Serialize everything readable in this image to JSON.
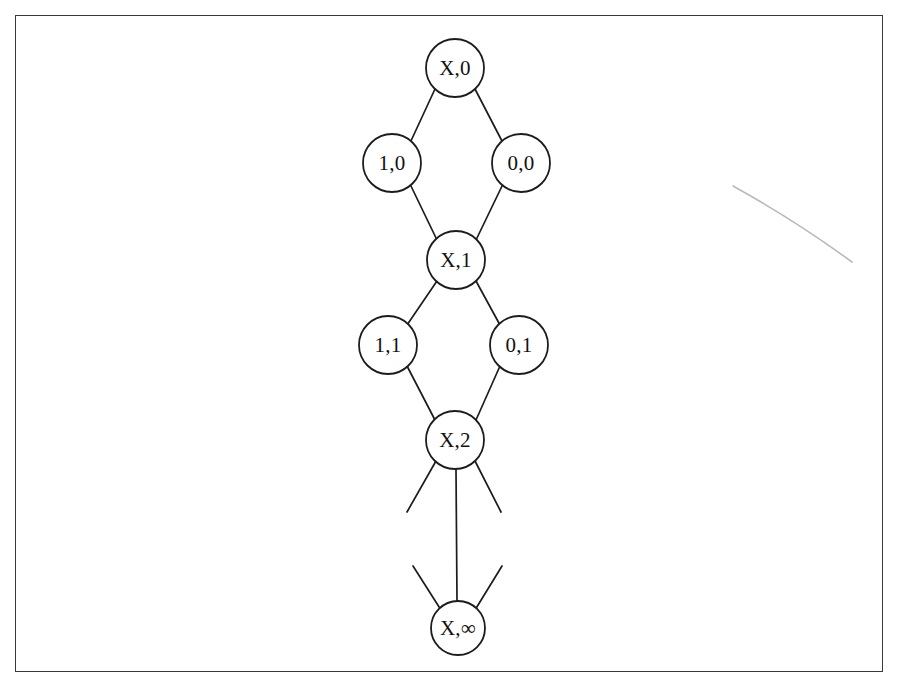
{
  "figure": {
    "title": "",
    "background_color": "#ffffff",
    "frame_color": "#3a3a3a",
    "stroke_color": "#1c1c1c",
    "label_color": "#111111",
    "width": 898,
    "height": 685
  },
  "diagram": {
    "type": "graph",
    "node_radius": 29,
    "nodes": [
      {
        "id": "x0",
        "label": "X,0",
        "cx": 455,
        "cy": 68,
        "r": 29,
        "font_size": 21
      },
      {
        "id": "n10",
        "label": "1,0",
        "cx": 392,
        "cy": 163,
        "r": 29,
        "font_size": 21
      },
      {
        "id": "n00",
        "label": "0,0",
        "cx": 521,
        "cy": 163,
        "r": 29,
        "font_size": 21
      },
      {
        "id": "x1",
        "label": "X,1",
        "cx": 456,
        "cy": 260,
        "r": 29,
        "font_size": 21
      },
      {
        "id": "n11",
        "label": "1,1",
        "cx": 388,
        "cy": 345,
        "r": 29,
        "font_size": 21
      },
      {
        "id": "n01",
        "label": "0,1",
        "cx": 519,
        "cy": 345,
        "r": 29,
        "font_size": 21
      },
      {
        "id": "x2",
        "label": "X,2",
        "cx": 455,
        "cy": 440,
        "r": 29,
        "font_size": 21
      },
      {
        "id": "xinf",
        "label": "X,∞",
        "cx": 458,
        "cy": 628,
        "r": 27,
        "font_size": 21
      }
    ],
    "edges": [
      {
        "from": "x0",
        "to": "n10",
        "x1": 435,
        "y1": 89,
        "x2": 410,
        "y2": 143
      },
      {
        "from": "x0",
        "to": "n00",
        "x1": 475,
        "y1": 89,
        "x2": 503,
        "y2": 143
      },
      {
        "from": "n10",
        "to": "x1",
        "x1": 410,
        "y1": 184,
        "x2": 437,
        "y2": 240
      },
      {
        "from": "n00",
        "to": "x1",
        "x1": 503,
        "y1": 184,
        "x2": 476,
        "y2": 240
      },
      {
        "from": "x1",
        "to": "n11",
        "x1": 437,
        "y1": 281,
        "x2": 407,
        "y2": 325
      },
      {
        "from": "x1",
        "to": "n01",
        "x1": 476,
        "y1": 281,
        "x2": 500,
        "y2": 325
      },
      {
        "from": "n11",
        "to": "x2",
        "x1": 407,
        "y1": 366,
        "x2": 435,
        "y2": 420
      },
      {
        "from": "n01",
        "to": "x2",
        "x1": 500,
        "y1": 366,
        "x2": 476,
        "y2": 420
      },
      {
        "from": "x2",
        "to": "xinf",
        "x1": 456,
        "y1": 469,
        "x2": 457,
        "y2": 601
      }
    ],
    "dangling_edges": [
      {
        "anchor": "x2",
        "direction": "down-left",
        "x1": 436,
        "y1": 461,
        "x2": 407,
        "y2": 512
      },
      {
        "anchor": "x2",
        "direction": "down-right",
        "x1": 475,
        "y1": 461,
        "x2": 501,
        "y2": 512
      },
      {
        "anchor": "xinf",
        "direction": "up-left",
        "x1": 413,
        "y1": 566,
        "x2": 441,
        "y2": 610
      },
      {
        "anchor": "xinf",
        "direction": "up-right",
        "x1": 502,
        "y1": 566,
        "x2": 475,
        "y2": 610
      }
    ],
    "artifacts": [
      {
        "name": "scan-smudge",
        "path": "M 733 186 C 780 212, 822 240, 852 262",
        "color": "#b9b9b9",
        "width": 1.6
      }
    ]
  }
}
